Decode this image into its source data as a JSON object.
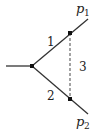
{
  "diagram": {
    "type": "feynman-triangle-vertex",
    "labels": {
      "line1": "1",
      "line2": "2",
      "line3": "3",
      "p1_base": "p",
      "p1_sub": "1",
      "p2_base": "p",
      "p2_sub": "2"
    },
    "nodes": [
      {
        "id": "vertex",
        "x": 32,
        "y": 66
      },
      {
        "id": "top",
        "x": 70,
        "y": 33
      },
      {
        "id": "bottom",
        "x": 70,
        "y": 99
      }
    ],
    "edges": [
      {
        "from": "incoming",
        "to": "vertex",
        "style": "solid"
      },
      {
        "from": "vertex",
        "to": "top",
        "label": "1",
        "style": "solid"
      },
      {
        "from": "vertex",
        "to": "bottom",
        "label": "2",
        "style": "solid"
      },
      {
        "from": "top",
        "to": "bottom",
        "label": "3",
        "style": "dashed"
      },
      {
        "from": "top",
        "to": "p1",
        "style": "solid"
      },
      {
        "from": "bottom",
        "to": "p2",
        "style": "solid"
      }
    ],
    "colors": {
      "line": "#222222",
      "dashed": "#555555"
    }
  }
}
